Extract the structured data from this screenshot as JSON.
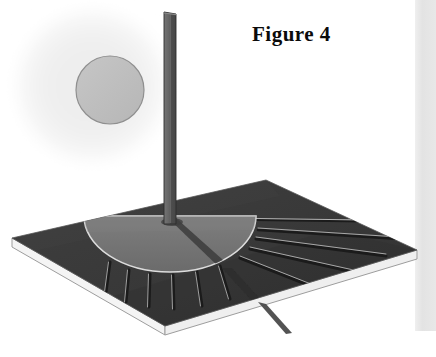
{
  "figure": {
    "caption": "Figure 4",
    "kind": "sundial-perspective-illustration",
    "width": 436,
    "height": 357
  },
  "colors": {
    "page_background": "#ffffff",
    "board_surface": "#3a3a3a",
    "board_surface_dark": "#313131",
    "board_edge_white": "#f2f2f2",
    "board_edge_line": "#9a9a9a",
    "dial_face": "#6f6f6f",
    "dial_face_light": "#7c7c7c",
    "dial_outline": "#d8d8d8",
    "gnomon_light": "#6a6a6a",
    "gnomon_dark": "#4a4a4a",
    "gnomon_outline": "#2a2a2a",
    "hour_line_dark": "#1d1d1d",
    "hour_line_light": "#b9b9b9",
    "shadow": "#2b2b2b",
    "sun_glow": "#f0f0f0",
    "sun_disc": "#bfbfbf",
    "sun_disc_outline": "#8c8c8c",
    "right_strip": "#e4e4e4"
  },
  "elements": {
    "sun_glow": {
      "cx": 92,
      "cy": 86,
      "r": 80,
      "label": "sun-glow"
    },
    "sun_disc": {
      "cx": 110,
      "cy": 90,
      "r": 34,
      "label": "sun-disc"
    },
    "gnomon": {
      "label": "gnomon-rod",
      "top_y": 12,
      "base_y": 224,
      "left_x": 164,
      "right_x": 176
    },
    "board": {
      "label": "dial-base-board",
      "corner_left": [
        12,
        238
      ],
      "corner_top": [
        266,
        180
      ],
      "corner_right": [
        417,
        250
      ],
      "corner_bottom": [
        165,
        326
      ],
      "thickness": 9
    },
    "dial_face": {
      "label": "dial-half-disc",
      "cx": 170,
      "cy": 216,
      "rx": 86,
      "ry": 56
    },
    "shadow_ray": {
      "label": "gnomon-shadow",
      "from": [
        170,
        218
      ],
      "to": [
        292,
        332
      ]
    }
  },
  "hour_lines": {
    "label": "hour-lines",
    "count": 11,
    "short_left": [
      {
        "x1": 110,
        "y1": 262,
        "x2": 106,
        "y2": 292
      },
      {
        "x1": 129,
        "y1": 270,
        "x2": 126,
        "y2": 302
      },
      {
        "x1": 150,
        "y1": 274,
        "x2": 149,
        "y2": 307
      },
      {
        "x1": 172,
        "y1": 275,
        "x2": 173,
        "y2": 309
      },
      {
        "x1": 196,
        "y1": 272,
        "x2": 201,
        "y2": 305
      },
      {
        "x1": 219,
        "y1": 267,
        "x2": 229,
        "y2": 299
      }
    ],
    "long_right": [
      {
        "x1": 240,
        "y1": 258,
        "x2": 316,
        "y2": 288
      },
      {
        "x1": 250,
        "y1": 249,
        "x2": 356,
        "y2": 272
      },
      {
        "x1": 256,
        "y1": 239,
        "x2": 384,
        "y2": 255
      },
      {
        "x1": 258,
        "y1": 230,
        "x2": 398,
        "y2": 238
      },
      {
        "x1": 256,
        "y1": 221,
        "x2": 400,
        "y2": 222
      }
    ]
  },
  "right_strip": {
    "label": "page-edge-strip",
    "x": 415,
    "y": 0,
    "width": 21,
    "height": 331
  }
}
